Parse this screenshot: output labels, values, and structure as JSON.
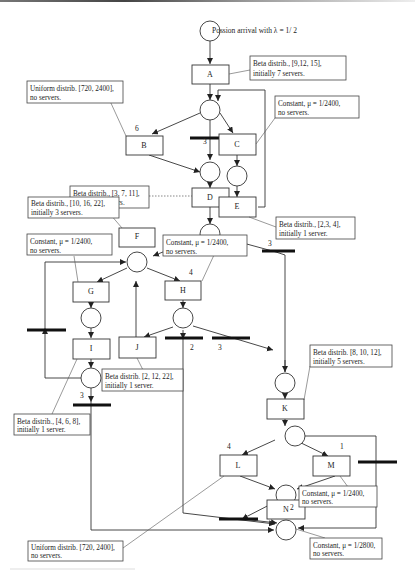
{
  "diagram": {
    "title_note": "Possion arrival with λ = 1/ 2",
    "transitions": {
      "A": "A",
      "B": "B",
      "C": "C",
      "D": "D",
      "E": "E",
      "F": "F",
      "G": "G",
      "H": "H",
      "I": "I",
      "J": "J",
      "K": "K",
      "L": "L",
      "M": "M",
      "N": "N"
    },
    "weights": {
      "b_in": "6",
      "bar1": "3",
      "bar_f": "3",
      "h_in": "4",
      "bar_h2": "2",
      "bar_h3": "3",
      "bar_i": "3",
      "l_in": "4",
      "m_in": "1",
      "n_in": "2"
    },
    "notes": {
      "a": [
        "Beta distrib., [9,12, 15],",
        "initially 7 servers."
      ],
      "b": [
        "Uniform distrib. [720, 2400],",
        "no servers."
      ],
      "c": [
        "Constant, μ = 1/2400,",
        "no servers."
      ],
      "d": [
        "Beta distrib., [3, 7, 11],",
        "initially 4 servers."
      ],
      "e": [
        "Beta distrib., [2,3, 4],",
        "initially 1 server."
      ],
      "f": [
        "Beta distrib., [10, 16, 22],",
        "initially 3 servers."
      ],
      "g": [
        "Constant, μ = 1/2400,",
        "no servers."
      ],
      "h": [
        "Constant, μ = 1/2400,",
        "no servers."
      ],
      "j": [
        "Beta distrib. [2, 12, 22],",
        "initially 1 server."
      ],
      "i": [
        "Beta distrib., [4, 6, 8],",
        "initially 1 server."
      ],
      "k": [
        "Beta distrib. [8, 10, 12],",
        "initially 5 servers."
      ],
      "m": [
        "Constant, μ = 1/2400,",
        "no servers."
      ],
      "l": [
        "Uniform distrib. [720, 2400],",
        "no servers."
      ],
      "n": [
        "Constant, μ = 1/2800,",
        "no servers."
      ]
    }
  }
}
